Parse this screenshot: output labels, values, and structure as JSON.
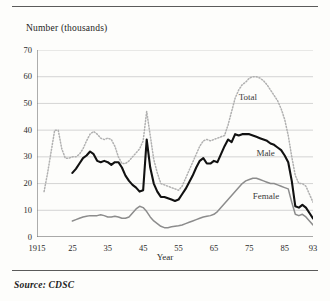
{
  "figure": {
    "y_axis_title": "Number (thousands)",
    "x_axis_title": "Year",
    "source_note": "Source: CDSC"
  },
  "colors": {
    "background": "#fdfdfb",
    "frame_rule": "#5a5a5a",
    "axis": "#6b6b6b",
    "gridline": "#c9c9c9",
    "total_series": "#b0b0b0",
    "male_series": "#111111",
    "female_series": "#8c8c8c",
    "tick_text": "#2a2a2a"
  },
  "axes": {
    "y_ticks": [
      "0",
      "10",
      "20",
      "30",
      "40",
      "50",
      "60",
      "70"
    ],
    "x_ticks": [
      "1915",
      "25",
      "35",
      "45",
      "55",
      "65",
      "75",
      "85",
      "93"
    ]
  },
  "series_labels": {
    "total": "Total",
    "male": "Male",
    "female": "Female"
  },
  "chart_data": {
    "type": "line",
    "title": "",
    "subtitle": "",
    "xlabel": "Year",
    "ylabel": "Number (thousands)",
    "xlim": [
      1915,
      1993
    ],
    "ylim": [
      0,
      70
    ],
    "y_ticks": [
      0,
      10,
      20,
      30,
      40,
      50,
      60,
      70
    ],
    "x_ticks": [
      1915,
      1925,
      1935,
      1945,
      1955,
      1965,
      1975,
      1985,
      1993
    ],
    "grid": "horizontal",
    "legend": "inline-annotations",
    "annotations": [
      {
        "text": "Total",
        "x": 1972,
        "y": 52
      },
      {
        "text": "Male",
        "x": 1977,
        "y": 31
      },
      {
        "text": "Female",
        "x": 1976,
        "y": 15
      }
    ],
    "series": [
      {
        "name": "Total",
        "style": "dotted",
        "color": "#b0b0b0",
        "x": [
          1917,
          1918,
          1919,
          1920,
          1921,
          1922,
          1923,
          1924,
          1925,
          1926,
          1927,
          1928,
          1929,
          1930,
          1931,
          1932,
          1933,
          1934,
          1935,
          1936,
          1937,
          1938,
          1939,
          1940,
          1941,
          1942,
          1943,
          1944,
          1945,
          1946,
          1947,
          1948,
          1949,
          1950,
          1951,
          1952,
          1953,
          1954,
          1955,
          1956,
          1957,
          1958,
          1959,
          1960,
          1961,
          1962,
          1963,
          1964,
          1965,
          1966,
          1967,
          1968,
          1969,
          1970,
          1971,
          1972,
          1973,
          1974,
          1975,
          1976,
          1977,
          1978,
          1979,
          1980,
          1981,
          1982,
          1983,
          1984,
          1985,
          1986,
          1987,
          1988,
          1989,
          1990,
          1991,
          1992,
          1993
        ],
        "values": [
          17,
          24,
          32,
          40,
          40,
          33,
          29.5,
          29.5,
          30,
          30,
          31,
          33,
          36,
          38.5,
          39.5,
          38.5,
          37,
          36.5,
          37,
          36.5,
          34,
          30,
          27.5,
          27.5,
          28.5,
          30,
          31.5,
          33,
          36,
          47,
          38,
          29,
          24,
          20,
          19.5,
          19,
          18.5,
          18,
          17.5,
          19,
          22,
          25,
          28,
          31,
          34,
          36,
          36.5,
          36,
          36.5,
          37,
          37.5,
          38,
          42,
          47,
          52,
          55,
          57,
          58,
          59.5,
          60,
          60,
          59.5,
          58.5,
          57,
          55,
          53,
          51,
          48,
          44,
          38,
          30,
          23,
          20,
          20,
          19,
          16,
          13
        ]
      },
      {
        "name": "Male",
        "style": "solid-thick",
        "color": "#111111",
        "x": [
          1925,
          1926,
          1927,
          1928,
          1929,
          1930,
          1931,
          1932,
          1933,
          1934,
          1935,
          1936,
          1937,
          1938,
          1939,
          1940,
          1941,
          1942,
          1943,
          1944,
          1945,
          1946,
          1947,
          1948,
          1949,
          1950,
          1951,
          1952,
          1953,
          1954,
          1955,
          1956,
          1957,
          1958,
          1959,
          1960,
          1961,
          1962,
          1963,
          1964,
          1965,
          1966,
          1967,
          1968,
          1969,
          1970,
          1971,
          1972,
          1973,
          1974,
          1975,
          1976,
          1977,
          1978,
          1979,
          1980,
          1981,
          1982,
          1983,
          1984,
          1985,
          1986,
          1987,
          1988,
          1989,
          1990,
          1991,
          1992,
          1993
        ],
        "values": [
          24,
          25.5,
          27.5,
          29.5,
          30.5,
          32,
          31,
          28.5,
          28,
          28.5,
          28,
          27,
          28,
          28,
          26,
          23,
          21,
          19.5,
          18.5,
          17,
          17.5,
          36.5,
          26,
          20,
          17,
          15,
          15,
          14.5,
          14,
          13.5,
          14,
          16,
          18,
          20.5,
          23,
          26,
          28.5,
          29.5,
          27.5,
          27.5,
          28.5,
          28,
          31,
          34,
          36.5,
          35.5,
          38.5,
          38,
          38.5,
          38.5,
          38.5,
          38,
          37.5,
          37,
          36.5,
          36,
          35,
          34.5,
          33.5,
          32.5,
          30.5,
          28,
          21,
          11.5,
          11,
          12,
          11,
          9,
          7
        ]
      },
      {
        "name": "Female",
        "style": "solid-medium",
        "color": "#8c8c8c",
        "x": [
          1925,
          1926,
          1927,
          1928,
          1929,
          1930,
          1931,
          1932,
          1933,
          1934,
          1935,
          1936,
          1937,
          1938,
          1939,
          1940,
          1941,
          1942,
          1943,
          1944,
          1945,
          1946,
          1947,
          1948,
          1949,
          1950,
          1951,
          1952,
          1953,
          1954,
          1955,
          1956,
          1957,
          1958,
          1959,
          1960,
          1961,
          1962,
          1963,
          1964,
          1965,
          1966,
          1967,
          1968,
          1969,
          1970,
          1971,
          1972,
          1973,
          1974,
          1975,
          1976,
          1977,
          1978,
          1979,
          1980,
          1981,
          1982,
          1983,
          1984,
          1985,
          1986,
          1987,
          1988,
          1989,
          1990,
          1991,
          1992,
          1993
        ],
        "values": [
          6,
          6.5,
          7,
          7.5,
          7.8,
          8,
          8,
          8,
          8.3,
          8,
          7.5,
          7.5,
          7.8,
          7.5,
          7,
          7,
          7.5,
          9,
          10.5,
          11.5,
          11,
          9.5,
          7.5,
          6,
          5,
          4,
          3.5,
          3.5,
          3.8,
          4,
          4.2,
          4.5,
          5,
          5.5,
          6,
          6.5,
          7,
          7.5,
          7.8,
          8,
          8.5,
          9.5,
          11,
          12.5,
          14,
          15.5,
          17,
          18.5,
          20,
          21,
          21.5,
          22,
          22,
          21.5,
          21,
          20.5,
          20,
          20,
          19.5,
          19,
          18.5,
          18,
          13,
          8.5,
          8,
          8.5,
          7.5,
          6,
          4.5
        ]
      }
    ]
  }
}
